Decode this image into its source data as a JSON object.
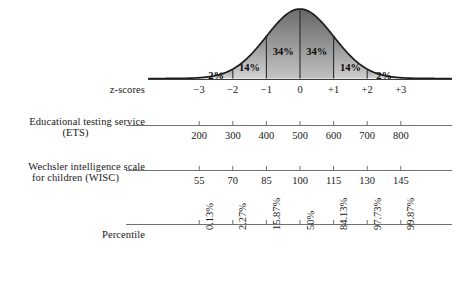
{
  "figure": {
    "curve_color": "#1c1c1c",
    "axis_color": "#6f6f6f",
    "text_color": "#181818"
  },
  "curve": {
    "band_labels": [
      "2%",
      "14%",
      "34%",
      "34%",
      "14%",
      "2%"
    ],
    "band_centers_z": [
      -2.5,
      -1.5,
      -0.5,
      0.5,
      1.5,
      2.5
    ]
  },
  "rows": [
    {
      "id": "z-scores",
      "label_line1": "z-scores",
      "label_line2": "",
      "values": [
        "−3",
        "−2",
        "−1",
        "0",
        "+1",
        "+2",
        "+3"
      ]
    },
    {
      "id": "ets",
      "label_line1": "Educational testing service",
      "label_line2": "(ETS)",
      "values": [
        "200",
        "300",
        "400",
        "500",
        "600",
        "700",
        "800"
      ]
    },
    {
      "id": "wisc",
      "label_line1": "Wechsler intelligence scale",
      "label_line2": "for children (WISC)",
      "values": [
        "55",
        "70",
        "85",
        "100",
        "115",
        "130",
        "145"
      ]
    },
    {
      "id": "percentile",
      "label_line1": "Percentile",
      "label_line2": "",
      "values": [
        "0.13%",
        "2.27%",
        "15.87%",
        "50%",
        "84.13%",
        "97.73%",
        "99.87%"
      ]
    }
  ],
  "chart_data": {
    "type": "area",
    "xlabel": "z-scores",
    "ylabel": "",
    "xlim": [
      -3.9,
      3.9
    ],
    "grid": false,
    "legend": "none",
    "distribution": "standard normal",
    "categories": [
      "−3",
      "−2",
      "−1",
      "0",
      "+1",
      "+2",
      "+3"
    ],
    "band_percentages": [
      2,
      14,
      34,
      34,
      14,
      2
    ],
    "band_ranges": [
      [
        -3,
        -2
      ],
      [
        -2,
        -1
      ],
      [
        -1,
        0
      ],
      [
        0,
        1
      ],
      [
        1,
        2
      ],
      [
        2,
        3
      ]
    ],
    "series": [
      {
        "name": "z-scores",
        "values": [
          -3,
          -2,
          -1,
          0,
          1,
          2,
          3
        ]
      },
      {
        "name": "Educational testing service (ETS)",
        "values": [
          200,
          300,
          400,
          500,
          600,
          700,
          800
        ]
      },
      {
        "name": "Wechsler intelligence scale for children (WISC)",
        "values": [
          55,
          70,
          85,
          100,
          115,
          130,
          145
        ]
      },
      {
        "name": "Percentile",
        "values": [
          0.13,
          2.27,
          15.87,
          50,
          84.13,
          97.73,
          99.87
        ]
      }
    ]
  }
}
